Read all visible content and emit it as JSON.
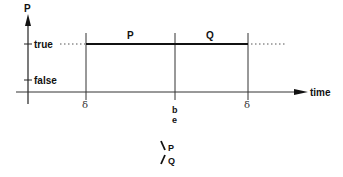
{
  "diagram": {
    "y_axis_label": "P",
    "x_axis_label": "time",
    "y_ticks": [
      "true",
      "false"
    ],
    "segments": [
      {
        "label": "P"
      },
      {
        "label": "Q"
      }
    ],
    "x_markers": [
      "δ",
      "b",
      "e",
      "δ"
    ],
    "legend": {
      "top": "P",
      "bottom": "Q"
    },
    "colors": {
      "line": "#111111",
      "axis": "#333333",
      "dotted": "#555555"
    }
  }
}
